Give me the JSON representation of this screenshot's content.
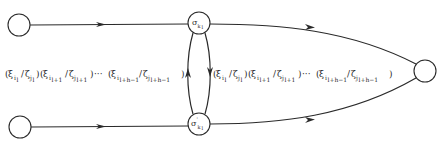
{
  "diagram": {
    "colors": {
      "stroke": "#2a2a2a",
      "background": "#ffffff"
    },
    "nodes": [
      {
        "id": "left-top",
        "label": "",
        "cx": 19,
        "cy": 25,
        "r": 11
      },
      {
        "id": "left-bottom",
        "label": "",
        "cx": 20,
        "cy": 127,
        "r": 11
      },
      {
        "id": "sigma-top",
        "label": "σ",
        "sub": "k_l",
        "cx": 199,
        "cy": 23,
        "r": 11
      },
      {
        "id": "sigma-bottom",
        "label": "σ'",
        "sub": "k_l",
        "cx": 199,
        "cy": 124,
        "r": 11
      },
      {
        "id": "right",
        "label": "",
        "cx": 425,
        "cy": 71,
        "r": 11
      }
    ],
    "labels": {
      "sigma_top": "σ",
      "sigma_top_sub": "k",
      "sigma_top_subsub": "l",
      "sigma_bottom": "σ",
      "sigma_bottom_prime": "'",
      "sigma_bottom_sub": "k",
      "sigma_bottom_subsub": "l",
      "left_sequence": "(ξ_{i_l}/ζ_{j_l})(ξ_{i_{l+1}}/ζ_{j_{l+1}})···(ξ_{i_{l+h-1}}/ζ_{j_{l+h-1}})",
      "right_sequence": "(ξ_{i_l}/ζ_{j_l})(ξ_{i_{l+1}}/ζ_{j_{l+1}})···(ξ_{i_{l+h-1}}/ζ_{j_{l+h-1}})",
      "seq_parts": {
        "open": "(",
        "xi": "ξ",
        "zeta": "ζ",
        "slash": "/",
        "close": ")",
        "dots": "···",
        "i": "i",
        "j": "j",
        "l": "l",
        "l1": "l+1",
        "lh": "l+h−1"
      }
    },
    "edges": [
      {
        "from": "left-top",
        "to": "sigma-top",
        "arrow": "right"
      },
      {
        "from": "left-bottom",
        "to": "sigma-bottom",
        "arrow": "right"
      },
      {
        "from": "sigma-top",
        "to": "right",
        "arrow": "right",
        "curved": true
      },
      {
        "from": "sigma-bottom",
        "to": "right",
        "arrow": "right",
        "curved": true
      },
      {
        "from": "sigma-bottom",
        "to": "sigma-top",
        "arrow": "up",
        "side": "left"
      },
      {
        "from": "sigma-top",
        "to": "sigma-bottom",
        "arrow": "down",
        "side": "right"
      }
    ]
  }
}
